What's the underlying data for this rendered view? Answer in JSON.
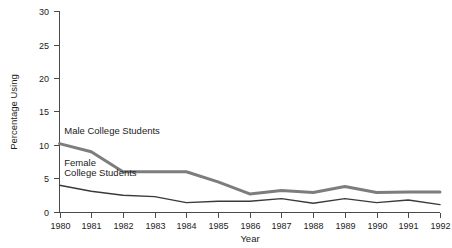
{
  "chart_data": {
    "type": "line",
    "title": "",
    "xlabel": "Year",
    "ylabel": "Percentage Using",
    "categories": [
      1980,
      1981,
      1982,
      1983,
      1984,
      1985,
      1986,
      1987,
      1988,
      1989,
      1990,
      1991,
      1992
    ],
    "xtick_labels": [
      "1980",
      "1981",
      "1982",
      "1983",
      "1984",
      "1985",
      "1986",
      "1987",
      "1988",
      "1989",
      "1990",
      "1991",
      "1992"
    ],
    "ytick_labels": [
      "0",
      "5",
      "10",
      "15",
      "20",
      "25",
      "30"
    ],
    "ytick_values": [
      0,
      5,
      10,
      15,
      20,
      25,
      30
    ],
    "xlim": [
      1980,
      1992
    ],
    "ylim": [
      0,
      30
    ],
    "grid": false,
    "legend_position": "inline-annotations",
    "series": [
      {
        "name": "Male College Students",
        "label": "Male College Students",
        "color": "#7d7d7d",
        "line_width": 3,
        "values": [
          10.2,
          9.0,
          6.0,
          6.0,
          6.0,
          4.5,
          2.7,
          3.2,
          2.9,
          3.8,
          2.9,
          3.0,
          3.0
        ]
      },
      {
        "name": "Female College Students",
        "label": "Female College Students",
        "label_line1": "Female",
        "label_line2": "College Students",
        "color": "#3a3a3a",
        "line_width": 1.4,
        "values": [
          4.0,
          3.1,
          2.5,
          2.3,
          1.4,
          1.6,
          1.6,
          2.0,
          1.3,
          2.0,
          1.4,
          1.8,
          1.1
        ]
      }
    ],
    "annotations": [
      {
        "text": "Male College Students",
        "x": 1980.15,
        "y": 11.6
      },
      {
        "text": "Female",
        "x": 1980.15,
        "y": 6.9
      },
      {
        "text": "College Students",
        "x": 1980.15,
        "y": 5.3
      }
    ]
  },
  "axes": {
    "y_axis_title": "Percentage Using",
    "x_axis_title": "Year"
  }
}
